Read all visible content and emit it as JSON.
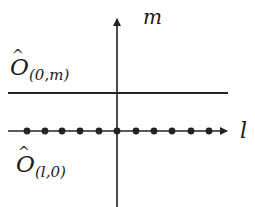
{
  "diagram": {
    "type": "lattice-axes",
    "colors": {
      "line": "#222222",
      "background": "#ffffff"
    },
    "vertical_axis": {
      "label": "m",
      "x": 117,
      "y_top": 17,
      "y_bottom": 207
    },
    "horizontal_line": {
      "y": 93,
      "x_start": 8,
      "x_end": 228
    },
    "horizontal_axis": {
      "label": "l",
      "y": 131,
      "x_start": 8,
      "x_end": 229
    },
    "dots_x": [
      27,
      45,
      62,
      80,
      99,
      117,
      136,
      154,
      172,
      191,
      209
    ],
    "labels": {
      "top_operator": {
        "base": "O",
        "hat": "^",
        "subscript": "(0,m)"
      },
      "bottom_operator": {
        "base": "O",
        "hat": "^",
        "subscript": "(l,0)"
      },
      "m_axis": "m",
      "l_axis": "l"
    }
  }
}
